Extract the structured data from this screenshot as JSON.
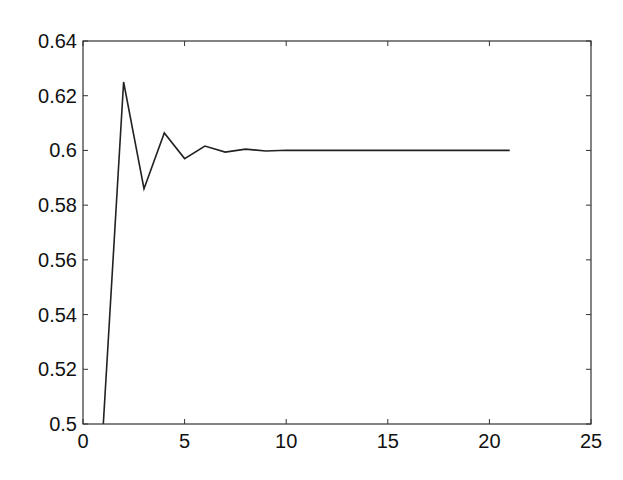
{
  "chart_data": {
    "type": "line",
    "title": "",
    "xlabel": "",
    "ylabel": "",
    "xlim": [
      0,
      25
    ],
    "ylim": [
      0.5,
      0.64
    ],
    "grid": false,
    "legend": null,
    "xticks": [
      0,
      5,
      10,
      15,
      20,
      25
    ],
    "xtick_labels": [
      "0",
      "5",
      "10",
      "15",
      "20",
      "25"
    ],
    "yticks": [
      0.5,
      0.52,
      0.54,
      0.56,
      0.58,
      0.6,
      0.62,
      0.64
    ],
    "ytick_labels": [
      "0.5",
      "0.52",
      "0.54",
      "0.56",
      "0.58",
      "0.6",
      "0.62",
      "0.64"
    ],
    "series": [
      {
        "name": "series-1",
        "color": "#222222",
        "x": [
          1,
          2,
          3,
          4,
          5,
          6,
          7,
          8,
          9,
          10,
          11,
          12,
          13,
          14,
          15,
          16,
          17,
          18,
          19,
          20,
          21
        ],
        "values": [
          0.5,
          0.625,
          0.586,
          0.6064,
          0.597,
          0.6016,
          0.5994,
          0.6005,
          0.5998,
          0.6001,
          0.6,
          0.6,
          0.6,
          0.6,
          0.6,
          0.6,
          0.6,
          0.6,
          0.6,
          0.6,
          0.6
        ]
      }
    ]
  },
  "colors": {
    "background": "#ffffff",
    "axes": "#333333",
    "line": "#222222",
    "text": "#111111"
  }
}
